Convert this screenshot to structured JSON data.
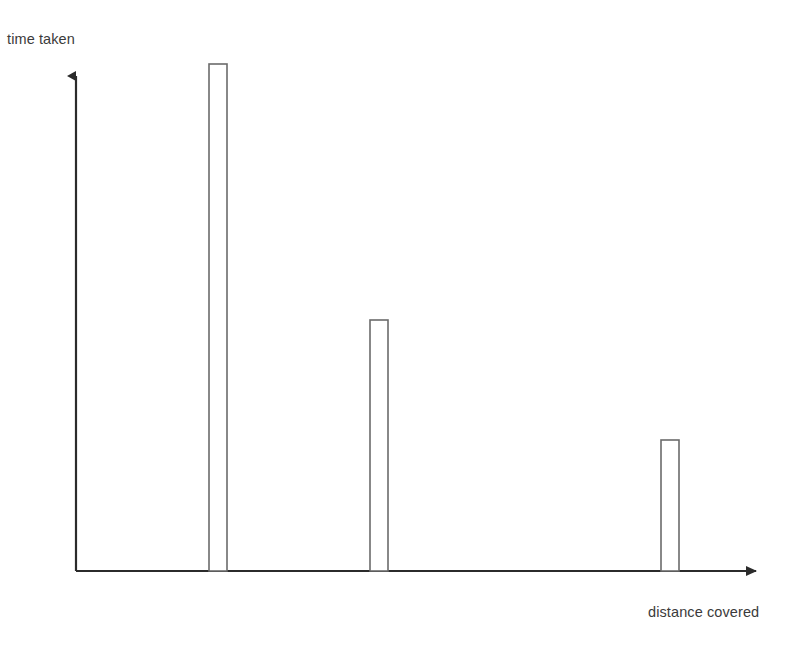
{
  "chart_data": {
    "type": "bar",
    "title": "",
    "subtitle": "",
    "xlabel": "distance covered",
    "ylabel": "time taken",
    "categories": [
      "1",
      "2",
      "3"
    ],
    "values": [
      507,
      251,
      131
    ],
    "value_unit": "px",
    "series": [
      {
        "name": "time taken",
        "values": [
          507,
          251,
          131
        ]
      }
    ],
    "bar_positions_px": [
      209,
      370,
      661
    ],
    "bar_width_px": 18,
    "baseline_y_px": 571,
    "axis_origin_px": [
      76,
      571
    ],
    "xlim": [
      76,
      765
    ],
    "ylim": [
      0,
      507
    ],
    "grid": false,
    "legend": false,
    "legend_position": "none",
    "annotations": [],
    "tick_labels_x": [],
    "tick_labels_y": [],
    "bar_fill_color": "#ffffff",
    "bar_stroke_color": "#6b6b6b",
    "axis_color": "#2b2b2b",
    "background_color": "#ffffff",
    "text_color": "#3b3b3b"
  },
  "labels": {
    "y_axis": "time taken",
    "x_axis": "distance covered"
  },
  "icons": {
    "y_arrow": "arrow-up-icon",
    "x_arrow": "arrow-right-icon"
  }
}
